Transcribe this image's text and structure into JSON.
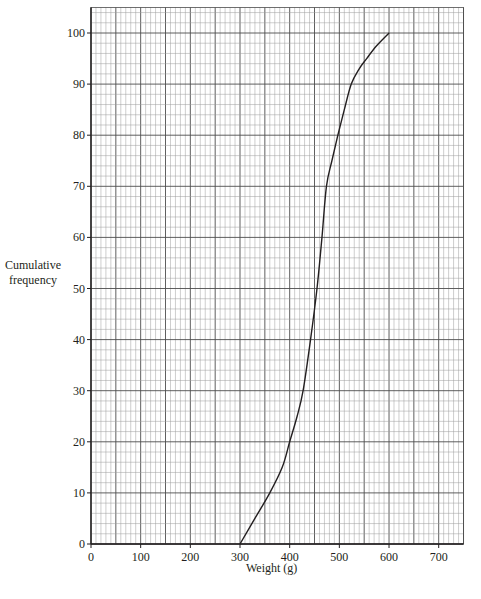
{
  "chart_data": {
    "type": "line",
    "title": "",
    "xlabel": "Weight (g)",
    "ylabel_lines": [
      "Cumulative",
      "frequency"
    ],
    "ylabel": "Cumulative frequency",
    "xlim": [
      0,
      750
    ],
    "ylim": [
      0,
      105
    ],
    "x_ticks": [
      0,
      100,
      200,
      300,
      400,
      500,
      600,
      700
    ],
    "y_ticks": [
      0,
      10,
      20,
      30,
      40,
      50,
      60,
      70,
      80,
      90,
      100
    ],
    "grid": {
      "on": true,
      "minor_x_step": 10,
      "minor_y_step": 2,
      "major_x_step": 50,
      "major_y_step": 10
    },
    "legend": null,
    "series": [
      {
        "name": "Cumulative frequency curve",
        "x": [
          300,
          330,
          360,
          385,
          400,
          415,
          427,
          442,
          455,
          465,
          474,
          485,
          497,
          510,
          524,
          540,
          555,
          575,
          600
        ],
        "y": [
          0,
          5,
          10,
          15,
          20,
          25,
          30,
          40,
          50,
          60,
          70,
          75,
          80,
          85,
          90,
          93,
          95,
          97.5,
          100
        ]
      }
    ]
  },
  "colors": {
    "axis": "#231f20",
    "minor_grid": "#9d9d9d",
    "major_grid": "#4d4d4d",
    "curve": "#231f20"
  }
}
